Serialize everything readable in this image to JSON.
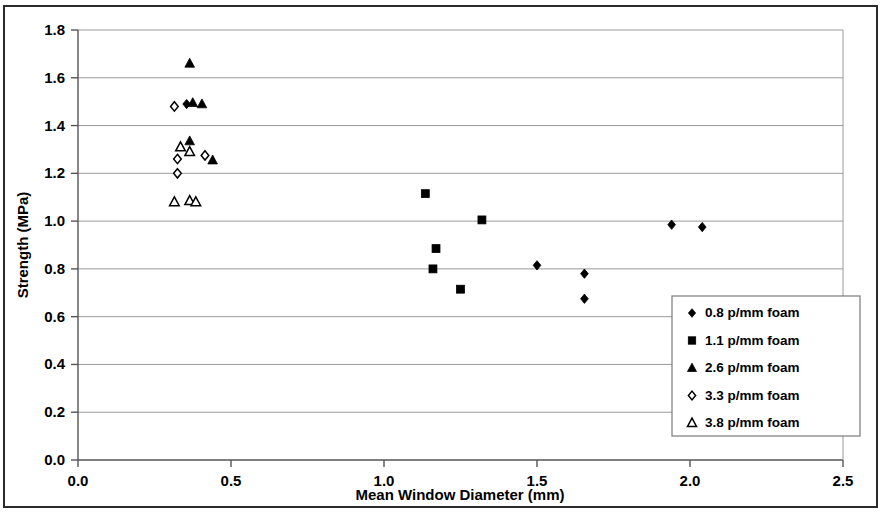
{
  "chart_data": {
    "type": "scatter",
    "title": "",
    "xlabel": "Mean Window Diameter  (mm)",
    "ylabel": "Strength (MPa)",
    "xlim": [
      0.0,
      2.5
    ],
    "ylim": [
      0.0,
      1.8
    ],
    "xticks": [
      "0.0",
      "0.5",
      "1.0",
      "1.5",
      "2.0",
      "2.5"
    ],
    "yticks": [
      "0.0",
      "0.2",
      "0.4",
      "0.6",
      "0.8",
      "1.0",
      "1.2",
      "1.4",
      "1.6",
      "1.8"
    ],
    "grid": "horizontal",
    "legend_position": "lower-right",
    "series": [
      {
        "name": "0.8 p/mm foam",
        "marker": "filled-diamond",
        "color": "#000000",
        "points": [
          {
            "x": 0.355,
            "y": 1.49
          },
          {
            "x": 1.5,
            "y": 0.815
          },
          {
            "x": 1.655,
            "y": 0.78
          },
          {
            "x": 1.655,
            "y": 0.675
          },
          {
            "x": 1.94,
            "y": 0.985
          },
          {
            "x": 2.04,
            "y": 0.975
          }
        ]
      },
      {
        "name": "1.1 p/mm foam",
        "marker": "filled-square",
        "color": "#000000",
        "points": [
          {
            "x": 1.135,
            "y": 1.115
          },
          {
            "x": 1.32,
            "y": 1.005
          },
          {
            "x": 1.17,
            "y": 0.885
          },
          {
            "x": 1.16,
            "y": 0.8
          },
          {
            "x": 1.25,
            "y": 0.715
          }
        ]
      },
      {
        "name": "2.6 p/mm foam",
        "marker": "filled-triangle",
        "color": "#000000",
        "points": [
          {
            "x": 0.365,
            "y": 1.66
          },
          {
            "x": 0.375,
            "y": 1.495
          },
          {
            "x": 0.405,
            "y": 1.49
          },
          {
            "x": 0.365,
            "y": 1.335
          },
          {
            "x": 0.44,
            "y": 1.255
          }
        ]
      },
      {
        "name": "3.3 p/mm foam",
        "marker": "open-diamond",
        "color": "#000000",
        "points": [
          {
            "x": 0.315,
            "y": 1.48
          },
          {
            "x": 0.325,
            "y": 1.26
          },
          {
            "x": 0.325,
            "y": 1.2
          },
          {
            "x": 0.415,
            "y": 1.275
          }
        ]
      },
      {
        "name": "3.8 p/mm foam",
        "marker": "open-triangle",
        "color": "#000000",
        "points": [
          {
            "x": 0.335,
            "y": 1.31
          },
          {
            "x": 0.365,
            "y": 1.29
          },
          {
            "x": 0.315,
            "y": 1.08
          },
          {
            "x": 0.365,
            "y": 1.085
          },
          {
            "x": 0.385,
            "y": 1.08
          }
        ]
      }
    ]
  },
  "axes": {
    "x_title": "Mean Window Diameter  (mm)",
    "y_title": "Strength (MPa)",
    "x_tick_labels": [
      "0.0",
      "0.5",
      "1.0",
      "1.5",
      "2.0",
      "2.5"
    ],
    "y_tick_labels": [
      "0.0",
      "0.2",
      "0.4",
      "0.6",
      "0.8",
      "1.0",
      "1.2",
      "1.4",
      "1.6",
      "1.8"
    ]
  },
  "legend": {
    "entries": [
      {
        "label": "0.8 p/mm foam",
        "marker": "filled-diamond"
      },
      {
        "label": "1.1 p/mm foam",
        "marker": "filled-square"
      },
      {
        "label": "2.6 p/mm foam",
        "marker": "filled-triangle"
      },
      {
        "label": "3.3 p/mm foam",
        "marker": "open-diamond"
      },
      {
        "label": "3.8 p/mm foam",
        "marker": "open-triangle"
      }
    ]
  },
  "colors": {
    "marker": "#000000",
    "gridline": "#9a9a9a",
    "axis": "#555555",
    "frame": "#2b2b2b",
    "background": "#ffffff"
  }
}
